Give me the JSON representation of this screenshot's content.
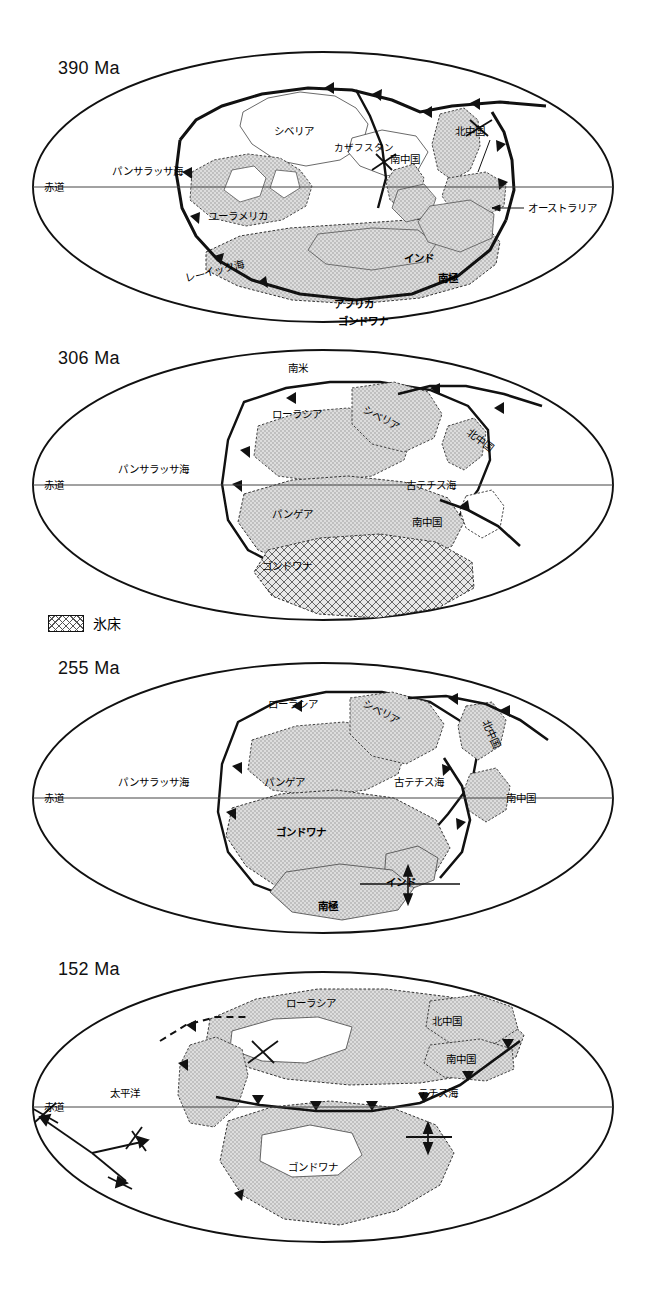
{
  "figure": {
    "type": "paleogeographic-map-series",
    "panel_count": 4,
    "colors": {
      "outline": "#111111",
      "land_fill": "#d4d4d4",
      "ocean_fill": "#ffffff",
      "ice_hatch": "#555555",
      "equator_line": "#444444"
    }
  },
  "legend": {
    "ice_sheet_label": "氷床",
    "swatch_name": "ice-sheet-swatch"
  },
  "panels": [
    {
      "id": "panel-390ma",
      "era": "390 Ma",
      "equator_label": "赤道",
      "labels": [
        {
          "text": "パンサラッサ海",
          "x": 148,
          "y": 47,
          "style": "lbl"
        },
        {
          "text": "シベリア",
          "x": 290,
          "y": 38,
          "style": "lbl"
        },
        {
          "text": "カザフスタン",
          "x": 356,
          "y": 51,
          "style": "lbl-sm"
        },
        {
          "text": "南中国",
          "x": 408,
          "y": 63,
          "style": "lbl"
        },
        {
          "text": "北中国",
          "x": 474,
          "y": 35,
          "style": "lbl"
        },
        {
          "text": "オーストラリア",
          "x": 533,
          "y": 124,
          "style": "lbl"
        },
        {
          "text": "ユーラメリカ",
          "x": 235,
          "y": 132,
          "style": "lbl"
        },
        {
          "text": "レーイック海",
          "x": 208,
          "y": 192,
          "style": "lbl"
        },
        {
          "text": "アフリカ",
          "x": 340,
          "y": 213,
          "style": "lbl-b"
        },
        {
          "text": "ゴンドワナ",
          "x": 348,
          "y": 236,
          "style": "lbl-b"
        },
        {
          "text": "インド",
          "x": 410,
          "y": 178,
          "style": "lbl-b"
        },
        {
          "text": "南極",
          "x": 446,
          "y": 188,
          "style": "lbl-b"
        }
      ]
    },
    {
      "id": "panel-306ma",
      "era": "306 Ma",
      "equator_label": "赤道",
      "labels": [
        {
          "text": "南米",
          "x": 300,
          "y": 22,
          "style": "lbl"
        },
        {
          "text": "ローラシア",
          "x": 288,
          "y": 68,
          "style": "lbl"
        },
        {
          "text": "シベリア",
          "x": 360,
          "y": 56,
          "style": "lbl"
        },
        {
          "text": "北中国",
          "x": 470,
          "y": 92,
          "style": "lbl"
        },
        {
          "text": "パンサラッサ海",
          "x": 128,
          "y": 118,
          "style": "lbl"
        },
        {
          "text": "古テチス海",
          "x": 430,
          "y": 128,
          "style": "lbl"
        },
        {
          "text": "パンゲア",
          "x": 288,
          "y": 166,
          "style": "lbl"
        },
        {
          "text": "南中国",
          "x": 428,
          "y": 180,
          "style": "lbl"
        },
        {
          "text": "ゴンドワナ",
          "x": 280,
          "y": 222,
          "style": "lbl"
        }
      ]
    },
    {
      "id": "panel-255ma",
      "era": "255 Ma",
      "equator_label": "赤道",
      "labels": [
        {
          "text": "ローラシア",
          "x": 290,
          "y": 46,
          "style": "lbl"
        },
        {
          "text": "シベリア",
          "x": 362,
          "y": 38,
          "style": "lbl"
        },
        {
          "text": "北中国",
          "x": 483,
          "y": 60,
          "style": "lbl"
        },
        {
          "text": "パンサラッサ海",
          "x": 128,
          "y": 108,
          "style": "lbl"
        },
        {
          "text": "パンゲア",
          "x": 280,
          "y": 108,
          "style": "lbl"
        },
        {
          "text": "古テチス海",
          "x": 410,
          "y": 108,
          "style": "lbl"
        },
        {
          "text": "南中国",
          "x": 508,
          "y": 128,
          "style": "lbl"
        },
        {
          "text": "ゴンドワナ",
          "x": 286,
          "y": 168,
          "style": "lbl-b"
        },
        {
          "text": "インド",
          "x": 398,
          "y": 216,
          "style": "lbl-b"
        },
        {
          "text": "南極",
          "x": 330,
          "y": 240,
          "style": "lbl-b"
        }
      ]
    },
    {
      "id": "panel-152ma",
      "era": "152 Ma",
      "equator_label": "赤道",
      "labels": [
        {
          "text": "ローラシア",
          "x": 310,
          "y": 42,
          "style": "lbl"
        },
        {
          "text": "北中国",
          "x": 455,
          "y": 62,
          "style": "lbl"
        },
        {
          "text": "南中国",
          "x": 470,
          "y": 100,
          "style": "lbl"
        },
        {
          "text": "テチス海",
          "x": 440,
          "y": 144,
          "style": "lbl"
        },
        {
          "text": "太平洋",
          "x": 128,
          "y": 138,
          "style": "lbl"
        },
        {
          "text": "ゴンドワナ",
          "x": 300,
          "y": 212,
          "style": "lbl"
        }
      ]
    }
  ]
}
